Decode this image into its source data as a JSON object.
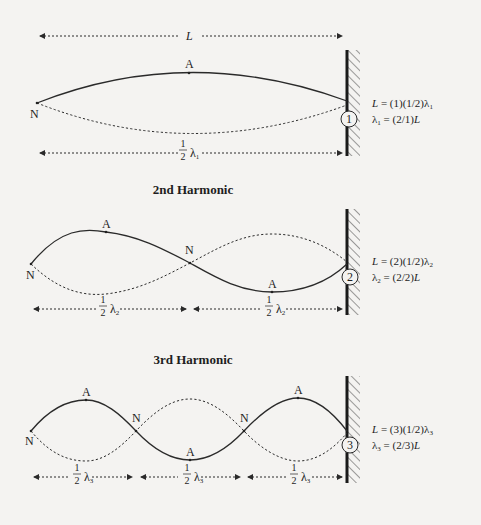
{
  "figure": {
    "labels": {
      "node": "N",
      "antinode": "A",
      "length": "L",
      "half": {
        "num": "1",
        "den": "2"
      },
      "lambda": "λ"
    },
    "harmonics": [
      {
        "n": 1,
        "title": "",
        "badge": "1",
        "eq1_prefix": "L",
        "eq1_rest": " = (1)(1/2)λ",
        "eq1_sub": "1",
        "eq2_lambda": "λ",
        "eq2_sub": "1",
        "eq2_rest": " = (2/1)",
        "eq2_L": "L",
        "half_sub": "1"
      },
      {
        "n": 2,
        "title": "2nd Harmonic",
        "badge": "2",
        "eq1_prefix": "L",
        "eq1_rest": " = (2)(1/2)λ",
        "eq1_sub": "2",
        "eq2_lambda": "λ",
        "eq2_sub": "2",
        "eq2_rest": " = (2/2)",
        "eq2_L": "L",
        "half_sub": "2"
      },
      {
        "n": 3,
        "title": "3rd Harmonic",
        "badge": "3",
        "eq1_prefix": "L",
        "eq1_rest": " = (3)(1/2)λ",
        "eq1_sub": "3",
        "eq2_lambda": "λ",
        "eq2_sub": "3",
        "eq2_rest": " = (2/3)",
        "eq2_L": "L",
        "half_sub": "3"
      }
    ]
  }
}
